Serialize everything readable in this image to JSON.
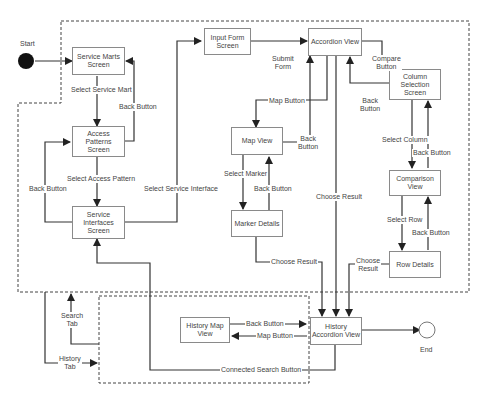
{
  "diagram": {
    "start_label": "Start",
    "end_label": "End",
    "states": {
      "service_marts": "Service Marts\nScreen",
      "access_patterns": "Access\nPatterns\nScreen",
      "service_interfaces": "Service\nInterfaces\nScreen",
      "input_form": "Input Form\nScreen",
      "accordion_view": "Accordion View",
      "map_view": "Map View",
      "marker_details": "Marker Details",
      "column_selection": "Column\nSelection\nScreen",
      "comparison_view": "Comparison\nView",
      "row_details": "Row Details",
      "history_map_view": "History Map\nView",
      "history_accordion_view": "History\nAccordion View"
    },
    "transitions": {
      "select_service_mart": "Select Service Mart",
      "back_button_1": "Back Button",
      "select_access_pattern": "Select Access Pattern",
      "back_button_2": "Back Button",
      "select_service_interface": "Select Service Interface",
      "submit_form": "Submit\nForm",
      "compare_button": "Compare\nButton",
      "map_button": "Map Button",
      "back_button_map": "Back\nButton",
      "back_button_column": "Back\nButton",
      "select_marker": "Select Marker",
      "back_button_marker": "Back Button",
      "choose_result_accordion": "Choose Result",
      "select_column": "Select Column",
      "back_button_comparison": "Back Button",
      "select_row": "Select Row",
      "back_button_row": "Back Button",
      "choose_result_marker": "Choose Result",
      "choose_result_row": "Choose\nResult",
      "history_back_button": "Back Button",
      "history_map_button": "Map Button",
      "connected_search_button": "Connected Search Button",
      "search_tab": "Search\nTab",
      "history_tab": "History\nTab"
    },
    "colors": {
      "line": "#333333",
      "box_border": "#8a8a8a",
      "text": "#444444",
      "start_fill": "#111111"
    }
  }
}
